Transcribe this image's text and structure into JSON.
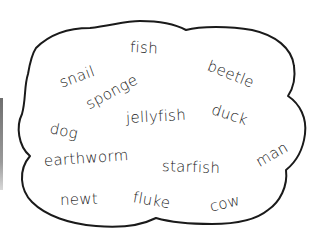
{
  "diagram": {
    "type": "word-cloud",
    "outline_color": "#1a1a1a",
    "words": [
      {
        "text": "fish",
        "x": 130,
        "y": 38,
        "rotate": 3
      },
      {
        "text": "beetle",
        "x": 208,
        "y": 58,
        "rotate": 22
      },
      {
        "text": "snail",
        "x": 60,
        "y": 72,
        "rotate": -20
      },
      {
        "text": "sponge",
        "x": 87,
        "y": 90,
        "rotate": -28
      },
      {
        "text": "jellyfish",
        "x": 126,
        "y": 112,
        "rotate": -3
      },
      {
        "text": "duck",
        "x": 212,
        "y": 102,
        "rotate": 18
      },
      {
        "text": "dog",
        "x": 50,
        "y": 119,
        "rotate": 12
      },
      {
        "text": "earthworm",
        "x": 44,
        "y": 152,
        "rotate": -4
      },
      {
        "text": "starfish",
        "x": 162,
        "y": 159,
        "rotate": 2
      },
      {
        "text": "man",
        "x": 257,
        "y": 148,
        "rotate": -30
      },
      {
        "text": "newt",
        "x": 60,
        "y": 192,
        "rotate": -2
      },
      {
        "text": "fluke",
        "x": 133,
        "y": 190,
        "rotate": 10
      },
      {
        "text": "cow",
        "x": 210,
        "y": 196,
        "rotate": -14
      }
    ]
  }
}
